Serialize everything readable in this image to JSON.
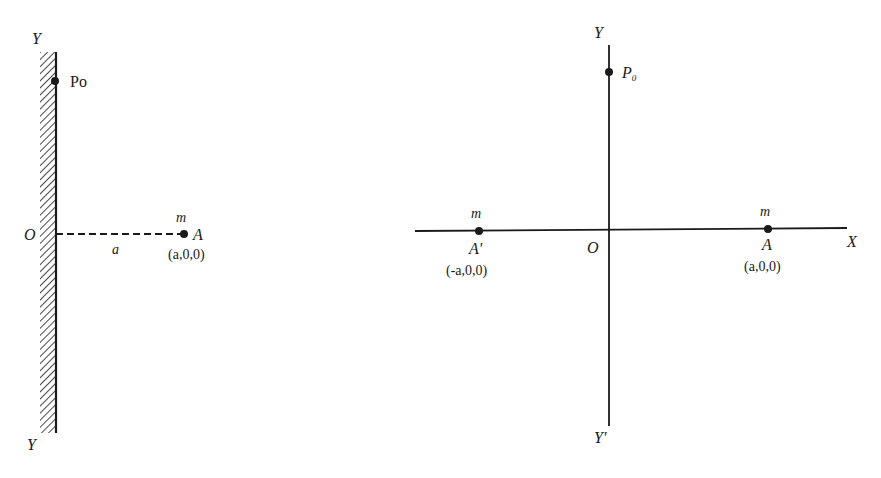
{
  "figure_left": {
    "title": "Point mass near an infinite plane wall",
    "labels": {
      "y_top": "Y",
      "y_bottom": "Y",
      "origin": "O",
      "p0": "Po",
      "mass": "m",
      "point": "A",
      "point_coords": "(a,0,0)",
      "distance": "a"
    }
  },
  "figure_right": {
    "title": "Method of images: mass and image mass",
    "labels": {
      "y_top": "Y",
      "y_bottom": "Y'",
      "x_axis": "X",
      "origin": "O",
      "p0_main": "P",
      "p0_sub": "0",
      "mass_real": "m",
      "point_real": "A",
      "point_real_coords": "(a,0,0)",
      "mass_image": "m",
      "point_image": "A'",
      "point_image_coords": "(-a,0,0)"
    }
  },
  "colors": {
    "ink": "#1a1a1a",
    "background": "#ffffff"
  }
}
